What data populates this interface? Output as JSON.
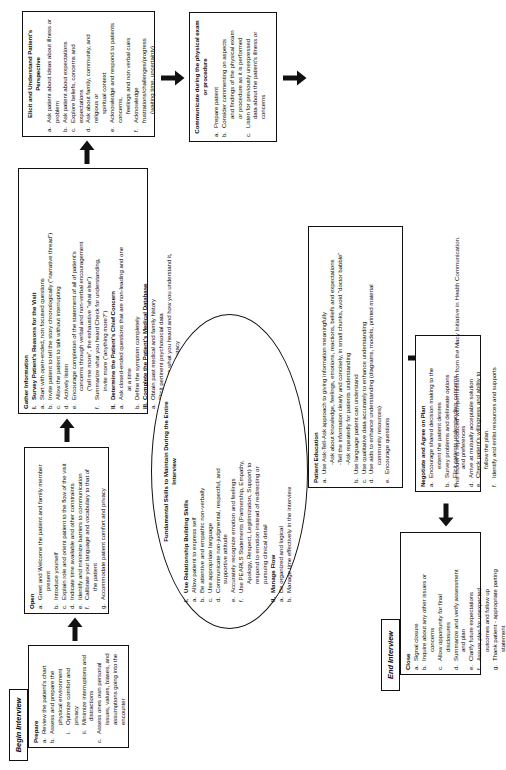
{
  "footnote": "This model is reproduced with permission from the Macy Initiative in Health Communication.",
  "tabs": {
    "begin": "Begin Interview",
    "end": "End Interview"
  },
  "boxes": {
    "prepare": {
      "heading": "Prepare",
      "items": [
        {
          "mark": "a.",
          "text": "Review the patient's chart",
          "level": 0
        },
        {
          "mark": "b.",
          "text": "Assess and prepare the",
          "level": 0
        },
        {
          "mark": "",
          "text": "physical environment",
          "level": "cont"
        },
        {
          "mark": "i.",
          "text": "Optimize comfort and privacy",
          "level": "sub"
        },
        {
          "mark": "ii.",
          "text": "Minimize interruptions and",
          "level": "sub"
        },
        {
          "mark": "",
          "text": "distractions",
          "level": "cont2"
        },
        {
          "mark": "c.",
          "text": "Assess ones own personal",
          "level": 0
        },
        {
          "mark": "",
          "text": "issues, values, biases, and",
          "level": "cont"
        },
        {
          "mark": "",
          "text": "assumptions going into the",
          "level": "cont"
        },
        {
          "mark": "",
          "text": "encounter",
          "level": "cont"
        }
      ]
    },
    "open": {
      "heading": "Open",
      "items": [
        {
          "mark": "a.",
          "text": "Greet and Welcome the patient and family member",
          "level": 0
        },
        {
          "mark": "",
          "text": "present",
          "level": "cont"
        },
        {
          "mark": "b.",
          "text": "Introduce yourself",
          "level": 0
        },
        {
          "mark": "c.",
          "text": "Explain role and orient patient to the flow of the visit",
          "level": 0
        },
        {
          "mark": "d.",
          "text": "Indicate time available and other constraints",
          "level": 0
        },
        {
          "mark": "e.",
          "text": "Identify and minimize barriers to communication",
          "level": 0
        },
        {
          "mark": "f.",
          "text": "Calibrate your language and vocabulary to that of",
          "level": 0
        },
        {
          "mark": "",
          "text": "the patient",
          "level": "cont"
        },
        {
          "mark": "g.",
          "text": "Accommodate patient comfort and privacy",
          "level": 0
        }
      ]
    },
    "gather": {
      "heading": "Gather Information",
      "items": [
        {
          "mark": "I.",
          "text": "Survey Patient's Reasons for the Visit",
          "level": "roman"
        },
        {
          "mark": "a.",
          "text": "Start with open-ended, non focused questions",
          "level": 0
        },
        {
          "mark": "b.",
          "text": "Invite patient to tell the story chronologically (\"narrative thread\")",
          "level": 0
        },
        {
          "mark": "c.",
          "text": "Allow the patient to talk without interrupting",
          "level": 0
        },
        {
          "mark": "d.",
          "text": "Actively listen",
          "level": 0
        },
        {
          "mark": "e.",
          "text": "Encourage completion of the statement of all of patient's",
          "level": 0
        },
        {
          "mark": "",
          "text": "concerns through verbal and non-verbal encouragement",
          "level": "cont"
        },
        {
          "mark": "",
          "text": "(\"tell me more\", the exhaustive \"what else\")",
          "level": "cont"
        },
        {
          "mark": "f.",
          "text": "Summarize what you heard   Check for understanding,",
          "level": 0
        },
        {
          "mark": "",
          "text": "invite more (\"anything more?\")",
          "level": "cont"
        },
        {
          "mark": "II.",
          "text": "Determine the Patient's Chief Concern",
          "level": "roman"
        },
        {
          "mark": "a.",
          "text": "Ask closed-ended questions that are non-leading and one",
          "level": 0
        },
        {
          "mark": "",
          "text": "at a time",
          "level": "cont"
        },
        {
          "mark": "b.",
          "text": "Define the symptom completely",
          "level": 0
        },
        {
          "mark": "III.",
          "text": "Complete the Patient's Medical Database",
          "level": "roman"
        },
        {
          "mark": "a.",
          "text": "Obtain past medical and family history",
          "level": 0
        },
        {
          "mark": "b.",
          "text": "Elicit pertinent psychosocial data",
          "level": 0
        },
        {
          "mark": "c.",
          "text": "Summarize what you heard and how you understand it,",
          "level": 0
        },
        {
          "mark": "",
          "text": "check for accuracy",
          "level": "cont"
        }
      ]
    },
    "elicit": {
      "heading": "Elicit and Understand Patient's Perspective",
      "items": [
        {
          "mark": "a.",
          "text": "Ask patient about ideas about illness or problem",
          "level": 0
        },
        {
          "mark": "b.",
          "text": "Ask patient about expectations",
          "level": 0
        },
        {
          "mark": "c.",
          "text": "Explore beliefs, concerns and expectations",
          "level": 0
        },
        {
          "mark": "d.",
          "text": "Ask about family, community, and religious or",
          "level": 0
        },
        {
          "mark": "",
          "text": "spiritual context",
          "level": "cont"
        },
        {
          "mark": "e.",
          "text": "Acknowledge and respond to patients concerns,",
          "level": 0
        },
        {
          "mark": "",
          "text": "feelings and non verbal cues",
          "level": "cont"
        },
        {
          "mark": "f.",
          "text": "Acknowledge frustrations/challenges/progress",
          "level": 0
        },
        {
          "mark": "",
          "text": "(waiting time, uncertainty)",
          "level": "cont"
        }
      ]
    },
    "physical": {
      "heading": "Communicate during the physical exam or procedure",
      "items": [
        {
          "mark": "a.",
          "text": "Prepare patient",
          "level": 0
        },
        {
          "mark": "b.",
          "text": "Consider commenting on aspects",
          "level": 0
        },
        {
          "mark": "",
          "text": "and findings of the physical exam",
          "level": "cont"
        },
        {
          "mark": "",
          "text": "or procedure as it is performed",
          "level": "cont"
        },
        {
          "mark": "c.",
          "text": "Listen for previously unexpressed",
          "level": 0
        },
        {
          "mark": "",
          "text": "data about the patient's illness or",
          "level": "cont"
        },
        {
          "mark": "",
          "text": "concerns",
          "level": "cont"
        }
      ]
    },
    "education": {
      "heading": "Patient Education",
      "items": [
        {
          "mark": "a.",
          "text": "Use Ask-Tell-Ask approach to giving information meaningfully",
          "level": 0
        },
        {
          "mark": "",
          "text": "-Ask about knowledge, feelings, emotions, reactions, beliefs and expectations",
          "level": "cont"
        },
        {
          "mark": "",
          "text": "-Tell the information clearly and concisely, in small chunks, avoid \"doctor babble\"",
          "level": "cont"
        },
        {
          "mark": "",
          "text": "-Ask repeatedly for patients understanding",
          "level": "cont"
        },
        {
          "mark": "b.",
          "text": "Use language patient can understand",
          "level": 0
        },
        {
          "mark": "c.",
          "text": "Use qualitative data accurately to enhance understanding",
          "level": 0
        },
        {
          "mark": "d.",
          "text": "Use aids to enhance understanding (diagrams, models, printed material",
          "level": 0
        },
        {
          "mark": "",
          "text": "community resources)",
          "level": "cont"
        },
        {
          "mark": "e.",
          "text": "Encourage questions",
          "level": 0
        }
      ]
    },
    "negotiate": {
      "heading": "Negotiate and Agree on Plan",
      "items": [
        {
          "mark": "a.",
          "text": "Encourage shared decision making to the",
          "level": 0
        },
        {
          "mark": "",
          "text": "extent the patient desires",
          "level": "cont"
        },
        {
          "mark": "b.",
          "text": "Survey problems and delineate options",
          "level": 0
        },
        {
          "mark": "c.",
          "text": "Elicit patients understanding, concerns,",
          "level": 0
        },
        {
          "mark": "",
          "text": "and preferences",
          "level": "cont"
        },
        {
          "mark": "d.",
          "text": "Arrive at mutually acceptable solution",
          "level": 0
        },
        {
          "mark": "e.",
          "text": "Check patient's willingness and ability to",
          "level": 0
        },
        {
          "mark": "",
          "text": "follow the plan.",
          "level": "cont"
        },
        {
          "mark": "f.",
          "text": "Identify and enlist resources and supports",
          "level": 0
        }
      ]
    },
    "close": {
      "heading": "Close",
      "items": [
        {
          "mark": "a.",
          "text": "Signal closure",
          "level": 0
        },
        {
          "mark": "b.",
          "text": "Inquire about any other issues or",
          "level": 0
        },
        {
          "mark": "",
          "text": "concerns",
          "level": "cont"
        },
        {
          "mark": "c.",
          "text": "Allow opportunity for final",
          "level": 0
        },
        {
          "mark": "",
          "text": "disclosures",
          "level": "cont"
        },
        {
          "mark": "d.",
          "text": "Summarize and verify assessment",
          "level": 0
        },
        {
          "mark": "",
          "text": "and plan",
          "level": "cont"
        },
        {
          "mark": "e.",
          "text": "Clarify future expectations",
          "level": 0
        },
        {
          "mark": "f.",
          "text": "Assure plan for unexpected",
          "level": 0
        },
        {
          "mark": "",
          "text": "outcomes and follow up",
          "level": "cont"
        },
        {
          "mark": "g.",
          "text": "Thank patient - appropriate parting",
          "level": 0
        },
        {
          "mark": "",
          "text": "statement",
          "level": "cont"
        }
      ]
    }
  },
  "oval": {
    "heading_line1": "Fundamental Skills to Maintain During the Entire",
    "heading_line2": "Interview",
    "items": [
      {
        "mark": "I.",
        "text": "Use Relationship Building Skills",
        "level": "roman"
      },
      {
        "mark": "a.",
        "text": "Allow patient to express self",
        "level": 0
      },
      {
        "mark": "b.",
        "text": "Be attentive and empathic non-verbally",
        "level": 0
      },
      {
        "mark": "c.",
        "text": "Use appropriate language",
        "level": 0
      },
      {
        "mark": "d.",
        "text": "Communicate non-judgmental, respectful, and",
        "level": 0
      },
      {
        "mark": "",
        "text": "supportive attitude",
        "level": "cont"
      },
      {
        "mark": "e.",
        "text": "Accurately recognize emotion and feelings",
        "level": 0
      },
      {
        "mark": "f.",
        "text": "Use PEARLS Statements (Partnership, Empathy,",
        "level": 0
      },
      {
        "mark": "",
        "text": "Apology, Respect, Legitimization, Support) to",
        "level": "cont"
      },
      {
        "mark": "",
        "text": "respond to emotion instead of redirecting or",
        "level": "cont"
      },
      {
        "mark": "",
        "text": "pursuing clinical detail",
        "level": "cont"
      },
      {
        "mark": "II.",
        "text": "Manage Flow",
        "level": "roman"
      },
      {
        "mark": "a.",
        "text": "Be organized and logical",
        "level": 0
      },
      {
        "mark": "b.",
        "text": "Manage time effectively in the interview",
        "level": 0
      }
    ]
  },
  "arrows": [
    {
      "name": "arrow-prepare-to-open",
      "direction": "right"
    },
    {
      "name": "arrow-open-to-gather",
      "direction": "right"
    },
    {
      "name": "arrow-gather-to-elicit",
      "direction": "right"
    },
    {
      "name": "arrow-elicit-to-physical",
      "direction": "right"
    },
    {
      "name": "arrow-physical-to-education",
      "direction": "right"
    },
    {
      "name": "arrow-education-to-negotiate",
      "direction": "down"
    },
    {
      "name": "arrow-negotiate-to-close",
      "direction": "down"
    }
  ]
}
